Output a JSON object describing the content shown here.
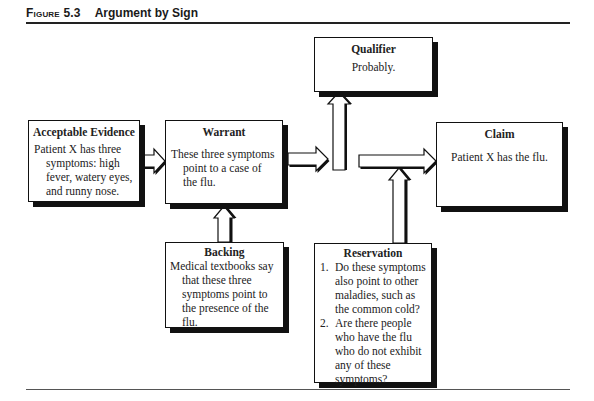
{
  "figure": {
    "label": "Figure 5.3",
    "title": "Argument by Sign"
  },
  "boxes": {
    "evidence": {
      "title": "Acceptable Evidence",
      "lines": [
        "Patient X has three",
        "symptoms: high",
        "fever, watery eyes,",
        "and runny nose."
      ]
    },
    "warrant": {
      "title": "Warrant",
      "lines": [
        "These three symptoms",
        "point to a case of",
        "the flu."
      ]
    },
    "qualifier": {
      "title": "Qualifier",
      "text": "Probably."
    },
    "claim": {
      "title": "Claim",
      "text": "Patient X has the flu."
    },
    "backing": {
      "title": "Backing",
      "lines": [
        "Medical textbooks say",
        "that these three",
        "symptoms point to",
        "the presence of the",
        "flu."
      ]
    },
    "reservation": {
      "title": "Reservation",
      "items": [
        {
          "num": "1.",
          "text": "Do these symptoms also point to other maladies, such as the common cold?"
        },
        {
          "num": "2.",
          "text": "Are there people who have the flu who do not exhibit any of these symptoms?"
        }
      ]
    }
  },
  "connections": [
    {
      "from": "evidence",
      "to": "warrant",
      "direction": "right"
    },
    {
      "from": "warrant",
      "to": "qualifier",
      "direction": "up"
    },
    {
      "from": "warrant",
      "to": "claim",
      "direction": "right"
    },
    {
      "from": "backing",
      "to": "warrant",
      "direction": "up"
    },
    {
      "from": "reservation",
      "to": "claim",
      "direction": "up"
    }
  ]
}
